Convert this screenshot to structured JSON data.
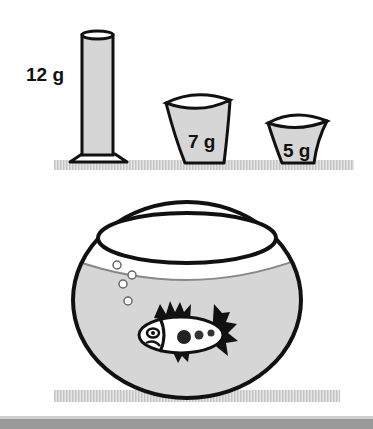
{
  "diagram": {
    "containers": [
      {
        "name": "graduated-cylinder",
        "label": "12 g"
      },
      {
        "name": "large-cup",
        "label": "7 g"
      },
      {
        "name": "small-cup",
        "label": "5 g"
      }
    ],
    "fishbowl": {
      "name": "fishbowl",
      "contents": [
        "water",
        "fish",
        "bubbles"
      ],
      "bubble_count": 4
    },
    "colors": {
      "liquid": "#d6d6d6",
      "outline": "#111111",
      "shelf": "#cfcfcf",
      "bottom_bar": "#9a9a9a"
    }
  }
}
